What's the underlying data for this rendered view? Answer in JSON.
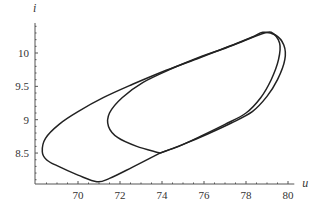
{
  "chart_data": {
    "type": "line",
    "title": "",
    "xlabel": "u",
    "ylabel": "i",
    "xlim": [
      68,
      80.3
    ],
    "ylim": [
      8.03,
      10.45
    ],
    "grid": false,
    "legend": null,
    "x_ticks": [
      70,
      72,
      74,
      76,
      78,
      80
    ],
    "x_tick_labels": [
      "70",
      "72",
      "74",
      "76",
      "78",
      "80"
    ],
    "y_ticks": [
      8.5,
      9,
      9.5,
      10
    ],
    "y_tick_labels": [
      "8.5",
      "9",
      "9.5",
      "10"
    ],
    "series": [
      {
        "name": "outer-loop",
        "points": [
          [
            73.9,
            8.5
          ],
          [
            72.6,
            8.29
          ],
          [
            71.5,
            8.12
          ],
          [
            70.9,
            8.07
          ],
          [
            70.0,
            8.17
          ],
          [
            69.0,
            8.31
          ],
          [
            68.5,
            8.4
          ],
          [
            68.3,
            8.52
          ],
          [
            68.45,
            8.72
          ],
          [
            69.1,
            8.93
          ],
          [
            70.0,
            9.12
          ],
          [
            71.2,
            9.33
          ],
          [
            72.6,
            9.53
          ],
          [
            74.2,
            9.74
          ],
          [
            75.8,
            9.93
          ],
          [
            77.2,
            10.1
          ],
          [
            78.3,
            10.24
          ],
          [
            78.8,
            10.31
          ],
          [
            79.4,
            10.27
          ],
          [
            79.8,
            10.12
          ],
          [
            79.85,
            9.9
          ],
          [
            79.5,
            9.6
          ],
          [
            79.0,
            9.35
          ],
          [
            78.3,
            9.12
          ],
          [
            77.3,
            8.95
          ],
          [
            76.2,
            8.79
          ],
          [
            75.0,
            8.63
          ],
          [
            73.9,
            8.5
          ]
        ]
      },
      {
        "name": "inner-loop",
        "points": [
          [
            73.9,
            8.5
          ],
          [
            72.8,
            8.6
          ],
          [
            71.9,
            8.73
          ],
          [
            71.45,
            8.9
          ],
          [
            71.5,
            9.1
          ],
          [
            72.1,
            9.33
          ],
          [
            73.1,
            9.56
          ],
          [
            74.5,
            9.77
          ],
          [
            75.9,
            9.95
          ],
          [
            76.9,
            10.06
          ],
          [
            77.8,
            10.17
          ],
          [
            78.6,
            10.27
          ],
          [
            79.2,
            10.31
          ],
          [
            79.6,
            10.15
          ],
          [
            79.55,
            9.9
          ],
          [
            79.2,
            9.6
          ],
          [
            78.7,
            9.33
          ],
          [
            78.0,
            9.1
          ],
          [
            77.0,
            8.93
          ],
          [
            75.9,
            8.76
          ],
          [
            74.8,
            8.6
          ],
          [
            73.9,
            8.5
          ]
        ]
      }
    ],
    "annotations": []
  },
  "colors": {
    "curve": "#222222",
    "axis": "#555555",
    "text": "#333333",
    "background": "#ffffff"
  }
}
